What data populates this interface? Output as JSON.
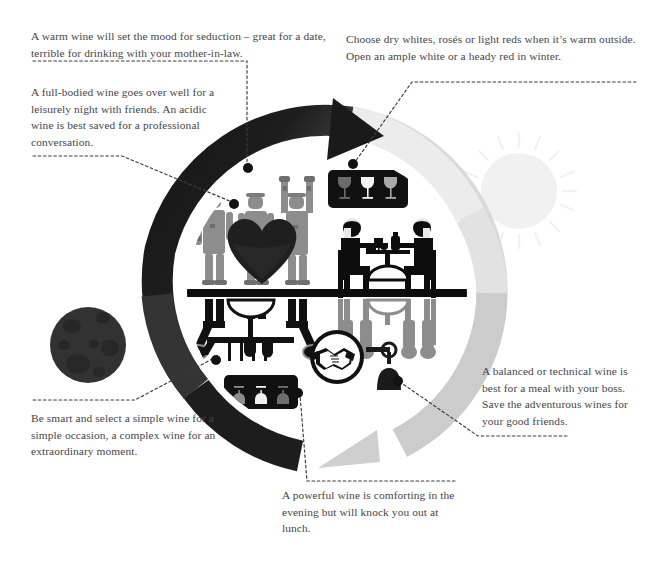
{
  "graphic": {
    "title": "Wine pairing cycle infographic",
    "background_color": "#ffffff",
    "text_color": "#45454a"
  },
  "callouts": [
    {
      "id": "seduction",
      "name": "callout-warm-wine-seduction",
      "text": "A warm wine will set the mood for seduction – great for a date, terrible for drinking with your mother-in-law.",
      "dot": {
        "x": 248,
        "y": 168
      }
    },
    {
      "id": "fullbody",
      "name": "callout-full-bodied-wine",
      "text": "A full-bodied wine goes over well for a leisurely night with friends. An acidic wine is best saved for a professional conversation.",
      "dot": {
        "x": 234,
        "y": 204
      }
    },
    {
      "id": "drywhites",
      "name": "callout-dry-whites-roses",
      "text": "Choose dry whites, rosés or light reds when it’s warm outside. Open an ample white or a heady red in winter.",
      "dot": {
        "x": 353,
        "y": 164
      }
    },
    {
      "id": "balanced",
      "name": "callout-balanced-technical-wine",
      "text": "A balanced or technical wine is best for a meal with your boss. Save the adventurous wines for your good friends.",
      "dot": {
        "x": 398,
        "y": 381
      }
    },
    {
      "id": "besmart",
      "name": "callout-simple-wine-simple-occasion",
      "text": "Be smart and select a simple wine for a simple occasion, a complex wine for an extraordinary moment.",
      "dot": {
        "x": 216,
        "y": 360
      }
    },
    {
      "id": "powerful",
      "name": "callout-powerful-wine-evening",
      "text": "A powerful wine is comforting in the evening but will knock you out at lunch.",
      "dot": {
        "x": 298,
        "y": 393
      }
    }
  ],
  "colors": {
    "arrow_dark": "#1b1b1b",
    "arrow_mid": "#3a3a3a",
    "arrow_light": "#c9c9c9",
    "figure_gray": "#8d8d8d",
    "figure_dark": "#2b2b2b",
    "heart": "#1f1f1f",
    "sun": "#f1f1f1",
    "moon": "#313131",
    "sign_panel": "#111111",
    "dot": "#111111",
    "leader_line": "#3a3a3c"
  },
  "elements": {
    "cycle_ring_label": "day-night cycle ring",
    "sun_label": "sun",
    "moon_label": "moon",
    "heart_label": "heart",
    "handshake_label": "handshake",
    "friends_group_label": "three friends celebrating",
    "couple_dining_label": "couple dining at table",
    "ground_line_label": "ground line",
    "sign_top_label": "wine glasses sign",
    "sign_bottom_label": "wine glasses sign reflected",
    "glass_count": 3
  }
}
